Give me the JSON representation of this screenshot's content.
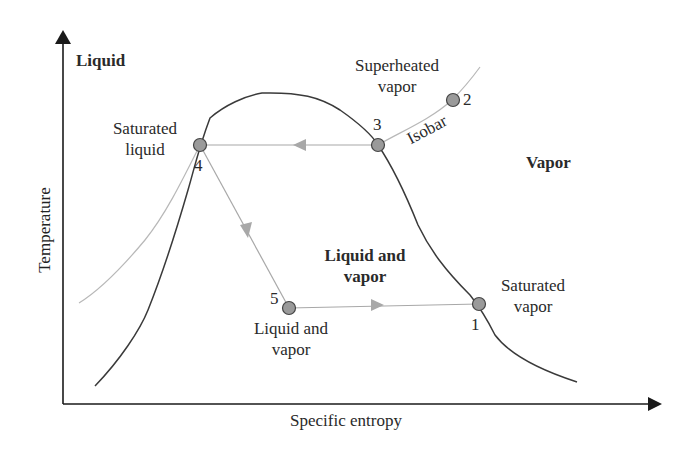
{
  "diagram": {
    "type": "T-s diagram (vapor-compression cycle)",
    "axes": {
      "x_label": "Specific entropy",
      "y_label": "Temperature"
    },
    "regions": {
      "liquid": "Liquid",
      "vapor": "Vapor",
      "liquid_and_vapor_line1": "Liquid and",
      "liquid_and_vapor_line2": "vapor"
    },
    "curve_labels": {
      "isobar": "Isobar"
    },
    "points": [
      {
        "id": "1",
        "label_line1": "Saturated",
        "label_line2": "vapor"
      },
      {
        "id": "2",
        "label_line1": "",
        "label_line2": ""
      },
      {
        "id": "3",
        "label_line1": "Superheated",
        "label_line2": "vapor"
      },
      {
        "id": "4",
        "label_line1": "Saturated",
        "label_line2": "liquid"
      },
      {
        "id": "5",
        "label_line1": "Liquid and",
        "label_line2": "vapor"
      }
    ],
    "colors": {
      "axis": "#1a1a1a",
      "saturation_dome": "#3a3a3a",
      "cycle_path": "#a8a8a8",
      "state_point_fill": "#9a9a9a",
      "state_point_stroke": "#444444"
    }
  }
}
